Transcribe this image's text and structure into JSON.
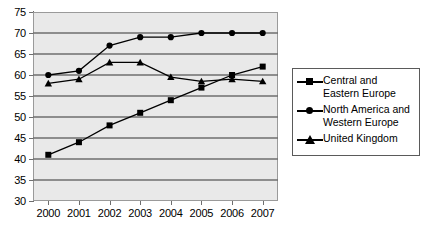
{
  "chart_data": {
    "type": "line",
    "title": "",
    "subtitle": "",
    "xlabel": "",
    "ylabel": "",
    "categories": [
      "2000",
      "2001",
      "2002",
      "2003",
      "2004",
      "2005",
      "2006",
      "2007"
    ],
    "x": [
      2000,
      2001,
      2002,
      2003,
      2004,
      2005,
      2006,
      2007
    ],
    "ylim": [
      30,
      75
    ],
    "ytick_step": 5,
    "yticks": [
      30,
      35,
      40,
      45,
      50,
      55,
      60,
      65,
      70,
      75
    ],
    "ytick_labels": [
      "30",
      "35",
      "40",
      "45",
      "50",
      "55",
      "60",
      "65",
      "70",
      "75"
    ],
    "grid": "horizontal",
    "legend_position": "right",
    "plot_background": "#e9e9e9",
    "gridline_color": "#6e6e6e",
    "series": [
      {
        "name": "Central and Eastern Europe",
        "marker": "square",
        "color": "#000000",
        "values": [
          41,
          44,
          48,
          51,
          54,
          57,
          60,
          62
        ]
      },
      {
        "name": "North America and Western Europe",
        "marker": "circle",
        "color": "#000000",
        "values": [
          60,
          61,
          67,
          69,
          69,
          70,
          70,
          70
        ]
      },
      {
        "name": "United Kingdom",
        "marker": "triangle",
        "color": "#000000",
        "values": [
          58,
          59,
          63,
          63,
          59.5,
          58.5,
          59,
          58.5
        ]
      }
    ]
  },
  "legend": {
    "items": [
      {
        "label": "Central and Eastern Europe",
        "marker": "square"
      },
      {
        "label": "North America and Western Europe",
        "marker": "circle"
      },
      {
        "label": "United Kingdom",
        "marker": "triangle"
      }
    ]
  }
}
